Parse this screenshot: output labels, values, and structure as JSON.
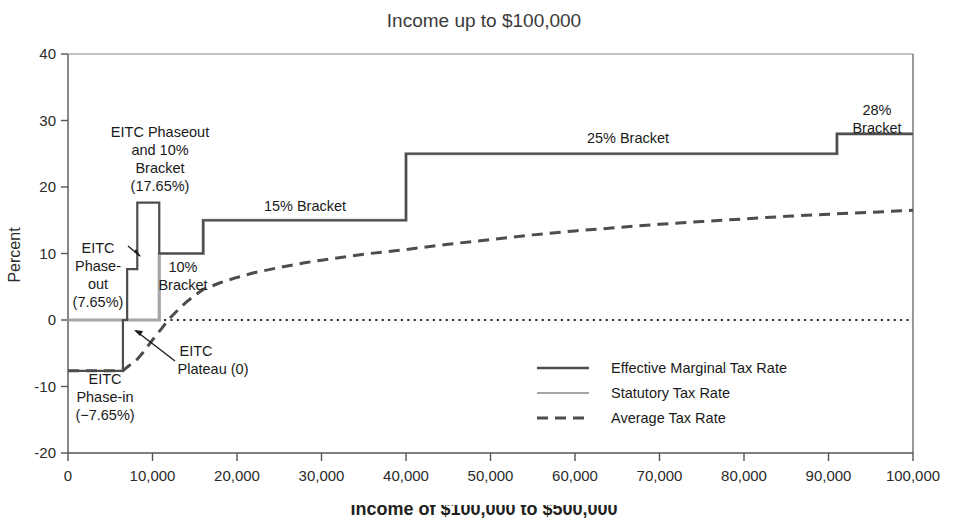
{
  "chart_data": {
    "type": "line",
    "title": "Income up to $100,000",
    "xlabel": "",
    "ylabel": "Percent",
    "xlim": [
      0,
      100000
    ],
    "ylim": [
      -20,
      40
    ],
    "grid": false,
    "legend_position": "lower-right",
    "xticks": [
      0,
      10000,
      20000,
      30000,
      40000,
      50000,
      60000,
      70000,
      80000,
      90000,
      100000
    ],
    "xticklabels": [
      "0",
      "10,000",
      "20,000",
      "30,000",
      "40,000",
      "50,000",
      "60,000",
      "70,000",
      "80,000",
      "90,000",
      "100,000"
    ],
    "yticks": [
      -20,
      -10,
      0,
      10,
      20,
      30,
      40
    ],
    "yticklabels": [
      "-20",
      "-10",
      "0",
      "10",
      "20",
      "30",
      "40"
    ],
    "series": [
      {
        "name": "Effective Marginal Tax Rate",
        "style": "solid-dark",
        "color": "#4d4d4d",
        "type": "step",
        "steps": [
          {
            "x0": 0,
            "x1": 6500,
            "y": -7.65
          },
          {
            "x0": 6500,
            "x1": 7000,
            "y": 0
          },
          {
            "x0": 7000,
            "x1": 8200,
            "y": 7.65
          },
          {
            "x0": 8200,
            "x1": 10800,
            "y": 17.65
          },
          {
            "x0": 10800,
            "x1": 16000,
            "y": 10
          },
          {
            "x0": 16000,
            "x1": 40000,
            "y": 15
          },
          {
            "x0": 40000,
            "x1": 91000,
            "y": 25
          },
          {
            "x0": 91000,
            "x1": 100000,
            "y": 28
          }
        ]
      },
      {
        "name": "Statutory Tax Rate",
        "style": "solid-light",
        "color": "#a6a6a6",
        "type": "step",
        "steps": [
          {
            "x0": 0,
            "x1": 10800,
            "y": 0
          },
          {
            "x0": 10800,
            "x1": 16000,
            "y": 10
          },
          {
            "x0": 16000,
            "x1": 40000,
            "y": 15
          },
          {
            "x0": 40000,
            "x1": 91000,
            "y": 25
          },
          {
            "x0": 91000,
            "x1": 100000,
            "y": 28
          }
        ]
      },
      {
        "name": "Average Tax Rate",
        "style": "dashed",
        "color": "#4d4d4d",
        "type": "curve",
        "points": [
          {
            "x": 0,
            "y": -7.65
          },
          {
            "x": 3000,
            "y": -7.65
          },
          {
            "x": 6500,
            "y": -7.65
          },
          {
            "x": 7000,
            "y": -7.1
          },
          {
            "x": 8200,
            "y": -5.9
          },
          {
            "x": 9000,
            "y": -4.7
          },
          {
            "x": 10000,
            "y": -3.0
          },
          {
            "x": 11000,
            "y": -1.4
          },
          {
            "x": 12000,
            "y": 0.2
          },
          {
            "x": 13000,
            "y": 1.5
          },
          {
            "x": 14000,
            "y": 2.7
          },
          {
            "x": 15000,
            "y": 3.7
          },
          {
            "x": 16000,
            "y": 4.6
          },
          {
            "x": 18000,
            "y": 5.6
          },
          {
            "x": 20000,
            "y": 6.4
          },
          {
            "x": 22000,
            "y": 7.1
          },
          {
            "x": 25000,
            "y": 7.9
          },
          {
            "x": 28000,
            "y": 8.6
          },
          {
            "x": 30000,
            "y": 9.0
          },
          {
            "x": 35000,
            "y": 9.9
          },
          {
            "x": 40000,
            "y": 10.6
          },
          {
            "x": 45000,
            "y": 11.4
          },
          {
            "x": 50000,
            "y": 12.1
          },
          {
            "x": 55000,
            "y": 12.8
          },
          {
            "x": 60000,
            "y": 13.4
          },
          {
            "x": 65000,
            "y": 13.9
          },
          {
            "x": 70000,
            "y": 14.4
          },
          {
            "x": 75000,
            "y": 14.8
          },
          {
            "x": 80000,
            "y": 15.2
          },
          {
            "x": 85000,
            "y": 15.6
          },
          {
            "x": 90000,
            "y": 15.9
          },
          {
            "x": 95000,
            "y": 16.2
          },
          {
            "x": 100000,
            "y": 16.5
          }
        ]
      },
      {
        "name": "Zero line",
        "style": "dotted",
        "color": "#333333",
        "type": "hline",
        "y": 0
      }
    ],
    "annotations": [
      {
        "id": "eitc-phasein",
        "text": "EITC\nPhase-in\n(−7.65%)",
        "x": 5500,
        "y": -11.5
      },
      {
        "id": "eitc-plateau",
        "text": "EITC\nPlateau (0)",
        "x": 17500,
        "y": -5.5
      },
      {
        "id": "eitc-phaseout",
        "text": "EITC\nPhase-\nout\n(7.65%)",
        "x": 3200,
        "y": 9.8
      },
      {
        "id": "eitc-10pct",
        "text": "EITC Phaseout\nand 10%\nBracket\n(17.65%)",
        "x": 11500,
        "y": 29.5
      },
      {
        "id": "bracket-10",
        "text": "10%\nBracket",
        "x": 16500,
        "y": 7.5
      },
      {
        "id": "bracket-15",
        "text": "15% Bracket",
        "x": 28000,
        "y": 18.0
      },
      {
        "id": "bracket-25",
        "text": "25% Bracket",
        "x": 66000,
        "y": 28.0
      },
      {
        "id": "bracket-28",
        "text": "28%\nBracket",
        "x": 96000,
        "y": 33.0
      }
    ]
  },
  "legend": {
    "items": [
      {
        "label": "Effective Marginal Tax Rate",
        "style": "solid-dark"
      },
      {
        "label": "Statutory Tax Rate",
        "style": "solid-light"
      },
      {
        "label": "Average Tax Rate",
        "style": "dashed"
      }
    ]
  },
  "annotation_text": {
    "eitc_phasein_l1": "EITC",
    "eitc_phasein_l2": "Phase-in",
    "eitc_phasein_l3": "(−7.65%)",
    "eitc_plateau_l1": "EITC",
    "eitc_plateau_l2": "Plateau (0)",
    "eitc_phaseout_l1": "EITC",
    "eitc_phaseout_l2": "Phase-",
    "eitc_phaseout_l3": "out",
    "eitc_phaseout_l4": "(7.65%)",
    "eitc_10pct_l1": "EITC Phaseout",
    "eitc_10pct_l2": "and 10%",
    "eitc_10pct_l3": "Bracket",
    "eitc_10pct_l4": "(17.65%)",
    "bracket10_l1": "10%",
    "bracket10_l2": "Bracket",
    "bracket15": "15% Bracket",
    "bracket25": "25% Bracket",
    "bracket28_l1": "28%",
    "bracket28_l2": "Bracket"
  },
  "axis": {
    "ylabel": "Percent"
  },
  "header": {
    "title": "Income up to $100,000"
  },
  "footer": {
    "next_chart_title_clipped": "Income of $100,000 to $500,000"
  }
}
